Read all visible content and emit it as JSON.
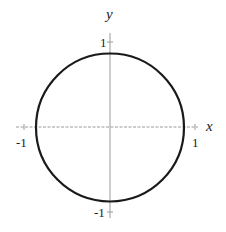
{
  "diagram": {
    "type": "unit-circle",
    "equation": "x^2 + y^2 = 1",
    "axes": {
      "x_label": "x",
      "y_label": "y",
      "x_ticks": [
        "-1",
        "1"
      ],
      "y_ticks": [
        "1",
        "-1"
      ]
    },
    "circle": {
      "center": [
        0,
        0
      ],
      "radius": 1,
      "stroke": "#1a1a1a"
    },
    "axis_color": "#999999"
  }
}
